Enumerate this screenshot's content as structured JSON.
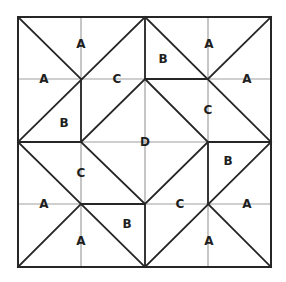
{
  "diagram": {
    "type": "quilt-block-piecing-diagram",
    "bounds": {
      "x0": 18,
      "y0": 17,
      "x1": 271,
      "y1": 267
    },
    "grid_x": [
      18,
      81,
      145,
      208,
      271
    ],
    "grid_y": [
      17,
      79,
      142,
      204,
      267
    ],
    "colors": {
      "background": "#ffffff",
      "grid": "#a0a0a0",
      "seam": "#262626",
      "label": "#1e1e1e"
    },
    "labels": [
      {
        "text": "A",
        "x": 81,
        "y": 44
      },
      {
        "text": "A",
        "x": 44,
        "y": 79
      },
      {
        "text": "C",
        "x": 117,
        "y": 79
      },
      {
        "text": "B",
        "x": 64,
        "y": 123
      },
      {
        "text": "B",
        "x": 163,
        "y": 59
      },
      {
        "text": "A",
        "x": 209,
        "y": 44
      },
      {
        "text": "A",
        "x": 247,
        "y": 79
      },
      {
        "text": "C",
        "x": 208,
        "y": 110
      },
      {
        "text": "D",
        "x": 145,
        "y": 142
      },
      {
        "text": "C",
        "x": 81,
        "y": 173
      },
      {
        "text": "B",
        "x": 228,
        "y": 161
      },
      {
        "text": "A",
        "x": 44,
        "y": 204
      },
      {
        "text": "C",
        "x": 180,
        "y": 204
      },
      {
        "text": "A",
        "x": 247,
        "y": 204
      },
      {
        "text": "B",
        "x": 127,
        "y": 224
      },
      {
        "text": "A",
        "x": 81,
        "y": 241
      },
      {
        "text": "A",
        "x": 209,
        "y": 241
      }
    ]
  }
}
